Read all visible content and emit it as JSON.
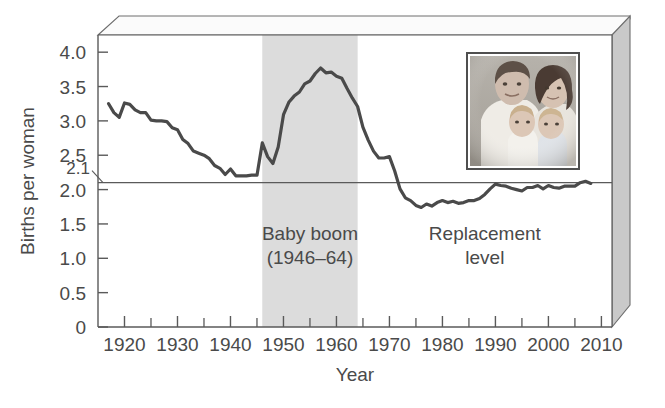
{
  "chart_data": {
    "type": "line",
    "title": "",
    "xlabel": "Year",
    "ylabel": "Births per woman",
    "xlim": [
      1915,
      2012
    ],
    "ylim": [
      0,
      4.25
    ],
    "grid": false,
    "legend": "none",
    "x_ticks_major": [
      1920,
      1930,
      1940,
      1950,
      1960,
      1970,
      1980,
      1990,
      2000,
      2010
    ],
    "x_ticks_minor": [
      1925,
      1935,
      1945,
      1955,
      1965,
      1975,
      1985,
      1995,
      2005
    ],
    "x_tick_labels": [
      "1920",
      "1930",
      "1940",
      "1950",
      "1960",
      "1970",
      "1980",
      "1990",
      "2000",
      "2010"
    ],
    "y_ticks": [
      0,
      0.5,
      1.0,
      1.5,
      2.0,
      2.5,
      3.0,
      3.5,
      4.0
    ],
    "y_tick_labels": [
      "0",
      "0.5",
      "1.0",
      "1.5",
      "2.0",
      "2.5",
      "3.0",
      "3.5",
      "4.0"
    ],
    "y_special_tick": 2.1,
    "y_special_label": "2.1",
    "reference_line": {
      "name": "replacement-level",
      "value": 2.1,
      "label_line1": "Replacement",
      "label_line2": "level",
      "label_x": 1988,
      "label_y": 1.32
    },
    "shaded_band": {
      "name": "baby-boom-band",
      "x_start": 1946,
      "x_end": 1964,
      "color": "#dcdcdc",
      "label_line1": "Baby boom",
      "label_line2": "(1946–64)",
      "label_x": 1955,
      "label_y": 1.32
    },
    "series": [
      {
        "name": "Total fertility rate",
        "color": "#4a4a4a",
        "x": [
          1917,
          1918,
          1919,
          1920,
          1921,
          1922,
          1923,
          1924,
          1925,
          1926,
          1927,
          1928,
          1929,
          1930,
          1931,
          1932,
          1933,
          1934,
          1935,
          1936,
          1937,
          1938,
          1939,
          1940,
          1941,
          1942,
          1943,
          1944,
          1945,
          1946,
          1947,
          1948,
          1949,
          1950,
          1951,
          1952,
          1953,
          1954,
          1955,
          1956,
          1957,
          1958,
          1959,
          1960,
          1961,
          1962,
          1963,
          1964,
          1965,
          1966,
          1967,
          1968,
          1969,
          1970,
          1971,
          1972,
          1973,
          1974,
          1975,
          1976,
          1977,
          1978,
          1979,
          1980,
          1981,
          1982,
          1983,
          1984,
          1985,
          1986,
          1987,
          1988,
          1989,
          1990,
          1991,
          1992,
          1993,
          1994,
          1995,
          1996,
          1997,
          1998,
          1999,
          2000,
          2001,
          2002,
          2003,
          2004,
          2005,
          2006,
          2007,
          2008
        ],
        "values": [
          3.25,
          3.12,
          3.05,
          3.26,
          3.24,
          3.16,
          3.12,
          3.12,
          3.01,
          3.0,
          3.0,
          2.99,
          2.9,
          2.87,
          2.73,
          2.67,
          2.56,
          2.53,
          2.5,
          2.45,
          2.35,
          2.31,
          2.22,
          2.3,
          2.2,
          2.2,
          2.2,
          2.21,
          2.21,
          2.68,
          2.48,
          2.38,
          2.62,
          3.09,
          3.27,
          3.36,
          3.42,
          3.54,
          3.58,
          3.69,
          3.77,
          3.7,
          3.71,
          3.65,
          3.62,
          3.47,
          3.33,
          3.21,
          2.91,
          2.72,
          2.56,
          2.46,
          2.46,
          2.48,
          2.27,
          2.01,
          1.88,
          1.84,
          1.77,
          1.74,
          1.79,
          1.76,
          1.81,
          1.84,
          1.81,
          1.83,
          1.8,
          1.81,
          1.84,
          1.84,
          1.87,
          1.93,
          2.01,
          2.08,
          2.06,
          2.05,
          2.02,
          2.0,
          1.98,
          2.03,
          2.03,
          2.06,
          2.01,
          2.06,
          2.03,
          2.02,
          2.05,
          2.05,
          2.05,
          2.1,
          2.12,
          2.09
        ]
      }
    ]
  },
  "inset_photo": {
    "name": "family-photo",
    "caption": "photograph of a family of four: two adults and two young children",
    "x_year": 1989,
    "y_top": 3.9,
    "y_bottom": 2.2
  },
  "axis": {
    "y_title": "Births per woman",
    "x_title": "Year"
  }
}
